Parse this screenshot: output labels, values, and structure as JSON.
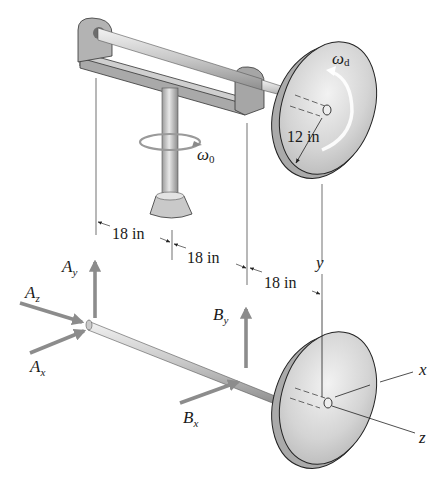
{
  "figure": {
    "type": "engineering-mechanics-diagram",
    "upper_assembly": {
      "omega_disk_label": "ω",
      "omega_disk_sub": "d",
      "omega_spin_label": "ω",
      "omega_spin_sub": "0",
      "radius_label": "12 in"
    },
    "dimensions": [
      {
        "label": "18 in"
      },
      {
        "label": "18 in"
      },
      {
        "label": "18 in"
      }
    ],
    "free_body": {
      "forces": [
        {
          "name": "A",
          "sub": "y"
        },
        {
          "name": "A",
          "sub": "z"
        },
        {
          "name": "A",
          "sub": "x"
        },
        {
          "name": "B",
          "sub": "y"
        },
        {
          "name": "B",
          "sub": "x"
        }
      ],
      "axes": {
        "x": "x",
        "y": "y",
        "z": "z"
      }
    },
    "colors": {
      "force_arrow": "#8c8c8c",
      "metal_light": "#e6e6e6",
      "metal_mid": "#bdbdbd",
      "metal_dark": "#8a8a8a",
      "line": "#222222"
    }
  }
}
